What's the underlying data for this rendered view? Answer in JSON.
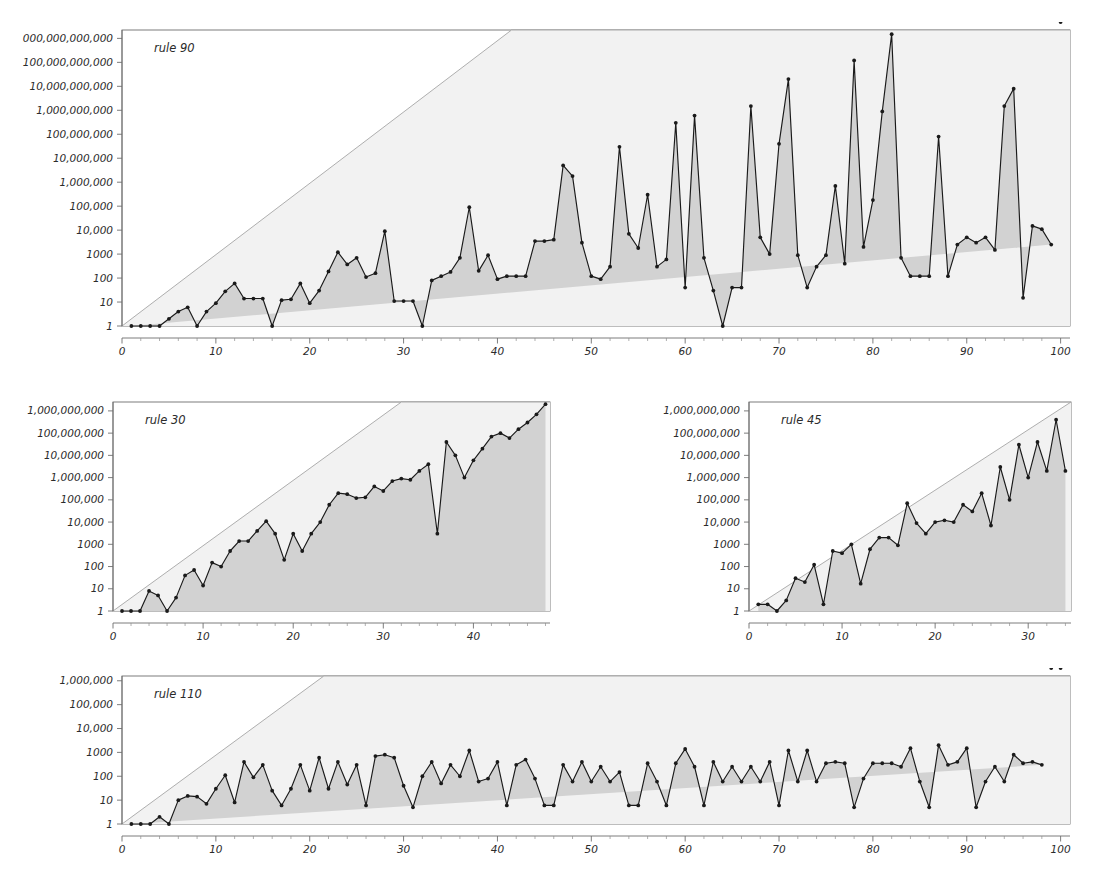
{
  "figure": {
    "title": "",
    "background": "#ffffff",
    "line_color": "#1a1a1a",
    "fill_color": "#d2d2d2",
    "bound_color": "#9a9a9a",
    "axis_color": "#8c8c8c",
    "text_color": "#2b2b2b"
  },
  "panels": [
    {
      "key": "rule90",
      "label": "rule 90",
      "x": 122,
      "y": 30,
      "w": 948,
      "h": 296,
      "xlabel": "",
      "ylabel": "",
      "xticks": [
        0,
        10,
        20,
        30,
        40,
        50,
        60,
        70,
        80,
        90,
        100
      ],
      "xticklabels": [
        "0",
        "10",
        "20",
        "30",
        "40",
        "50",
        "60",
        "70",
        "80",
        "90",
        "100"
      ],
      "xlim": [
        0,
        101
      ],
      "xminor_step": 2,
      "yticklabels": [
        "1",
        "10",
        "100",
        "1000",
        "10,000",
        "100,000",
        "1,000,000",
        "10,000,000",
        "100,000,000",
        "1,000,000,000",
        "10,000,000,000",
        "100,000,000,000",
        "1,000,000,000,000"
      ],
      "yexp": [
        0,
        1,
        2,
        3,
        4,
        5,
        6,
        7,
        8,
        9,
        10,
        11,
        12
      ],
      "ylim_exp": [
        0,
        12.35
      ],
      "bound_exp_at": [
        {
          "x": 0,
          "e": 0
        },
        {
          "x": 41.5,
          "e": 12.35
        }
      ],
      "bound_label": "2^n bound"
    },
    {
      "key": "rule30",
      "label": "rule 30",
      "x": 113,
      "y": 402,
      "w": 437,
      "h": 209,
      "xlabel": "",
      "ylabel": "",
      "xticks": [
        0,
        10,
        20,
        30,
        40
      ],
      "xticklabels": [
        "0",
        "10",
        "20",
        "30",
        "40"
      ],
      "xlim": [
        0,
        48.5
      ],
      "xminor_step": 2,
      "yticklabels": [
        "1",
        "10",
        "100",
        "1000",
        "10,000",
        "100,000",
        "1,000,000",
        "10,000,000",
        "100,000,000",
        "1,000,000,000"
      ],
      "yexp": [
        0,
        1,
        2,
        3,
        4,
        5,
        6,
        7,
        8,
        9
      ],
      "ylim_exp": [
        0,
        9.4
      ],
      "bound_exp_at": [
        {
          "x": 0,
          "e": 0
        },
        {
          "x": 32.0,
          "e": 9.4
        }
      ],
      "bound_label": "2^n bound"
    },
    {
      "key": "rule45",
      "label": "rule 45",
      "x": 749,
      "y": 402,
      "w": 322,
      "h": 209,
      "xlabel": "",
      "ylabel": "",
      "xticks": [
        0,
        10,
        20,
        30
      ],
      "xticklabels": [
        "0",
        "10",
        "20",
        "30"
      ],
      "xlim": [
        0,
        34.6
      ],
      "xminor_step": 2,
      "yticklabels": [
        "1",
        "10",
        "100",
        "1000",
        "10,000",
        "100,000",
        "1,000,000",
        "10,000,000",
        "100,000,000",
        "1,000,000,000"
      ],
      "yexp": [
        0,
        1,
        2,
        3,
        4,
        5,
        6,
        7,
        8,
        9
      ],
      "ylim_exp": [
        0,
        9.4
      ],
      "bound_exp_at": [
        {
          "x": 0,
          "e": 0
        },
        {
          "x": 34.6,
          "e": 9.4
        }
      ],
      "bound_label": "2^n bound"
    },
    {
      "key": "rule110",
      "label": "rule 110",
      "x": 122,
      "y": 676,
      "w": 948,
      "h": 148,
      "xlabel": "",
      "ylabel": "",
      "xticks": [
        0,
        10,
        20,
        30,
        40,
        50,
        60,
        70,
        80,
        90,
        100
      ],
      "xticklabels": [
        "0",
        "10",
        "20",
        "30",
        "40",
        "50",
        "60",
        "70",
        "80",
        "90",
        "100"
      ],
      "xlim": [
        0,
        101
      ],
      "xminor_step": 2,
      "yticklabels": [
        "1",
        "10",
        "100",
        "1000",
        "10,000",
        "100,000",
        "1,000,000"
      ],
      "yexp": [
        0,
        1,
        2,
        3,
        4,
        5,
        6
      ],
      "ylim_exp": [
        0,
        6.2
      ],
      "bound_exp_at": [
        {
          "x": 0,
          "e": 0
        },
        {
          "x": 21.5,
          "e": 6.2
        }
      ],
      "bound_label": "2^n bound"
    }
  ],
  "chart_data": [
    {
      "type": "line",
      "panel": "rule90",
      "title": "rule 90",
      "xlabel": "n",
      "ylabel": "",
      "yscale": "log",
      "ylim": [
        1,
        2240000000000
      ],
      "xlim": [
        0,
        101
      ],
      "grid": false,
      "legend": "none",
      "annotations": [
        "rule 90"
      ],
      "x": [
        1,
        2,
        3,
        4,
        5,
        6,
        7,
        8,
        9,
        10,
        11,
        12,
        13,
        14,
        15,
        16,
        17,
        18,
        19,
        20,
        21,
        22,
        23,
        24,
        25,
        26,
        27,
        28,
        29,
        30,
        31,
        32,
        33,
        34,
        35,
        36,
        37,
        38,
        39,
        40,
        41,
        42,
        43,
        44,
        45,
        46,
        47,
        48,
        49,
        50,
        51,
        52,
        53,
        54,
        55,
        56,
        57,
        58,
        59,
        60,
        61,
        62,
        63,
        64,
        65,
        66,
        67,
        68,
        69,
        70,
        71,
        72,
        73,
        74,
        75,
        76,
        77,
        78,
        79,
        80,
        81,
        82,
        83,
        84,
        85,
        86,
        87,
        88,
        89,
        90,
        91,
        92,
        93,
        94,
        95,
        96,
        97,
        98,
        99,
        100
      ],
      "values": [
        1,
        1,
        1,
        1,
        2,
        4,
        6,
        1,
        4,
        9,
        28,
        60,
        14,
        14,
        14,
        1,
        12,
        13,
        60,
        9,
        30,
        190,
        1200,
        370,
        700,
        110,
        160,
        9000,
        11,
        11,
        11,
        1,
        80,
        120,
        180,
        700,
        90000,
        200,
        900,
        90,
        120,
        120,
        120,
        3500,
        3500,
        4000,
        5000000,
        1800000,
        3000,
        120,
        90,
        300,
        30000000,
        7000,
        1800,
        300000,
        300,
        600,
        300000000,
        40,
        600000000,
        700,
        30,
        1,
        40,
        40,
        1500000000,
        5000,
        1000,
        40000000,
        20000000000,
        900,
        40,
        300,
        900,
        700000,
        400,
        120000000000,
        2000,
        180000,
        900000000,
        1500000000000,
        700,
        120,
        120,
        120,
        80000000,
        120,
        2500,
        5000,
        3000,
        5000,
        1500,
        1500000000,
        8000000000,
        15,
        15000,
        11000,
        2500
      ],
      "bound": "2^n"
    },
    {
      "type": "line",
      "panel": "rule30",
      "title": "rule 30",
      "xlabel": "n",
      "ylabel": "",
      "yscale": "log",
      "ylim": [
        1,
        2500000000
      ],
      "xlim": [
        0,
        48.5
      ],
      "grid": false,
      "legend": "none",
      "annotations": [
        "rule 30"
      ],
      "x": [
        1,
        2,
        3,
        4,
        5,
        6,
        7,
        8,
        9,
        10,
        11,
        12,
        13,
        14,
        15,
        16,
        17,
        18,
        19,
        20,
        21,
        22,
        23,
        24,
        25,
        26,
        27,
        28,
        29,
        30,
        31,
        32,
        33,
        34,
        35,
        36,
        37,
        38,
        39,
        40,
        41,
        42,
        43,
        44,
        45,
        46,
        47,
        48
      ],
      "values": [
        1,
        1,
        1,
        8,
        5,
        1,
        4,
        40,
        70,
        14,
        150,
        100,
        500,
        1400,
        1400,
        4000,
        11000,
        3000,
        200,
        3000,
        500,
        3000,
        10000,
        60000,
        200000,
        180000,
        120000,
        130000,
        400000,
        250000,
        700000,
        900000,
        800000,
        2000000,
        4000000,
        3000,
        40000000,
        10000000,
        1000000,
        6000000,
        20000000,
        70000000,
        100000000,
        60000000,
        150000000,
        300000000,
        700000000,
        2000000000
      ],
      "bound": "2^n"
    },
    {
      "type": "line",
      "panel": "rule45",
      "title": "rule 45",
      "xlabel": "n",
      "ylabel": "",
      "yscale": "log",
      "ylim": [
        1,
        2500000000
      ],
      "xlim": [
        0,
        34.6
      ],
      "grid": false,
      "legend": "none",
      "annotations": [
        "rule 45"
      ],
      "x": [
        1,
        2,
        3,
        4,
        5,
        6,
        7,
        8,
        9,
        10,
        11,
        12,
        13,
        14,
        15,
        16,
        17,
        18,
        19,
        20,
        21,
        22,
        23,
        24,
        25,
        26,
        27,
        28,
        29,
        30,
        31,
        32,
        33,
        34
      ],
      "values": [
        2,
        2,
        1,
        3,
        30,
        20,
        120,
        2,
        500,
        400,
        1000,
        17,
        600,
        2000,
        2000,
        900,
        70000,
        9000,
        3000,
        10000,
        12000,
        10000,
        60000,
        30000,
        200000,
        7000,
        3000000,
        100000,
        30000000,
        1000000,
        40000000,
        2000000,
        400000000,
        2000000
      ],
      "bound": "2^n"
    },
    {
      "type": "line",
      "panel": "rule110",
      "title": "rule 110",
      "xlabel": "n",
      "ylabel": "",
      "yscale": "log",
      "ylim": [
        1,
        1600000
      ],
      "xlim": [
        0,
        101
      ],
      "grid": false,
      "legend": "none",
      "annotations": [
        "rule 110"
      ],
      "x": [
        1,
        2,
        3,
        4,
        5,
        6,
        7,
        8,
        9,
        10,
        11,
        12,
        13,
        14,
        15,
        16,
        17,
        18,
        19,
        20,
        21,
        22,
        23,
        24,
        25,
        26,
        27,
        28,
        29,
        30,
        31,
        32,
        33,
        34,
        35,
        36,
        37,
        38,
        39,
        40,
        41,
        42,
        43,
        44,
        45,
        46,
        47,
        48,
        49,
        50,
        51,
        52,
        53,
        54,
        55,
        56,
        57,
        58,
        59,
        60,
        61,
        62,
        63,
        64,
        65,
        66,
        67,
        68,
        69,
        70,
        71,
        72,
        73,
        74,
        75,
        76,
        77,
        78,
        79,
        80,
        81,
        82,
        83,
        84,
        85,
        86,
        87,
        88,
        89,
        90,
        91,
        92,
        93,
        94,
        95,
        96,
        97,
        98,
        99,
        100
      ],
      "values": [
        1,
        1,
        1,
        2,
        1,
        10,
        15,
        14,
        7,
        30,
        110,
        8,
        400,
        90,
        300,
        25,
        6,
        30,
        300,
        25,
        600,
        30,
        400,
        45,
        300,
        6,
        700,
        800,
        600,
        40,
        5,
        100,
        400,
        50,
        300,
        100,
        1200,
        60,
        80,
        400,
        6,
        300,
        500,
        80,
        6,
        6,
        300,
        60,
        400,
        60,
        250,
        60,
        150,
        6,
        6,
        350,
        60,
        6,
        350,
        1400,
        250,
        6,
        400,
        60,
        250,
        60,
        250,
        60,
        400,
        6,
        1200,
        60,
        1200,
        60,
        350,
        400,
        350,
        5,
        80,
        350,
        350,
        350,
        250,
        1500,
        60,
        5,
        2000,
        300,
        400,
        1500,
        5,
        60,
        250,
        60,
        800,
        350,
        400,
        300
      ],
      "bound": "2^n"
    }
  ]
}
